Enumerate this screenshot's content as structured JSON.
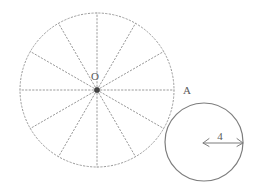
{
  "figure": {
    "background_color": "#ffffff",
    "stroke_color_dotted": "#9a9a9a",
    "stroke_color_solid": "#7d7d7d",
    "center_dot_color": "#444444",
    "label_color": "#5a5a5a"
  },
  "large_circle": {
    "name": "spoked-circle",
    "center_x": 97,
    "center_y": 90,
    "radius": 77,
    "stroke_style": "dotted",
    "spoke_count": 12,
    "spoke_angle_step_degrees": 30,
    "center_label": "O",
    "center_label_x": 95,
    "center_label_y": 80,
    "rim_label": "A",
    "rim_label_x": 183,
    "rim_label_y": 94
  },
  "small_circle": {
    "name": "measured-circle",
    "center_x": 204,
    "center_y": 142,
    "radius": 39,
    "stroke_style": "solid",
    "radius_label": "4",
    "radius_label_x": 220,
    "radius_label_y": 140,
    "arrow_start_x": 203,
    "arrow_end_x": 244,
    "arrow_y": 143
  },
  "icons": {
    "center_point": "dot-icon",
    "radius_arrow": "double-arrow-icon"
  }
}
